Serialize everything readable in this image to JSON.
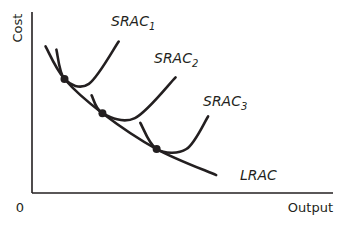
{
  "chart_data": {
    "type": "line",
    "title": "",
    "xlabel": "Output",
    "ylabel": "Cost",
    "origin_label": "0",
    "grid": false,
    "xlim": [
      0,
      10
    ],
    "ylim": [
      0,
      10
    ],
    "series": [
      {
        "name": "LRAC",
        "label_main": "LRAC",
        "label_sub": "",
        "kind": "long-run",
        "points": [
          [
            0.5,
            9.0
          ],
          [
            1.2,
            7.0
          ],
          [
            2.6,
            4.9
          ],
          [
            4.6,
            2.7
          ],
          [
            6.8,
            1.1
          ]
        ]
      },
      {
        "name": "SRAC1",
        "label_main": "SRAC",
        "label_sub": "1",
        "kind": "short-run",
        "points": [
          [
            0.9,
            8.8
          ],
          [
            1.2,
            7.0
          ],
          [
            2.1,
            6.7
          ],
          [
            3.2,
            9.3
          ]
        ]
      },
      {
        "name": "SRAC2",
        "label_main": "SRAC",
        "label_sub": "2",
        "kind": "short-run",
        "points": [
          [
            2.2,
            6.0
          ],
          [
            2.6,
            4.9
          ],
          [
            3.8,
            4.6
          ],
          [
            5.3,
            7.1
          ]
        ]
      },
      {
        "name": "SRAC3",
        "label_main": "SRAC",
        "label_sub": "3",
        "kind": "short-run",
        "points": [
          [
            4.0,
            4.3
          ],
          [
            4.6,
            2.7
          ],
          [
            5.7,
            2.7
          ],
          [
            6.5,
            4.7
          ]
        ]
      }
    ],
    "tangent_points": [
      {
        "x": 1.2,
        "y": 7.0,
        "label": "SRAC1-LRAC tangency"
      },
      {
        "x": 2.6,
        "y": 4.9,
        "label": "SRAC2-LRAC tangency"
      },
      {
        "x": 4.6,
        "y": 2.7,
        "label": "SRAC3-LRAC tangency"
      }
    ]
  }
}
